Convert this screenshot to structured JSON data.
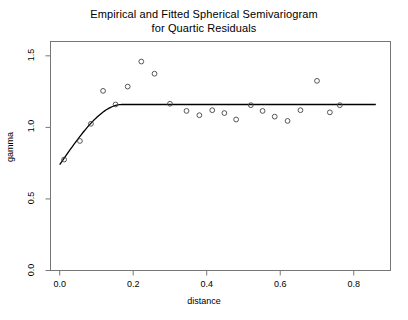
{
  "chart_data": {
    "type": "scatter",
    "title": "Empirical and Fitted Spherical Semivariogram for Quartic Residuals",
    "title_line1": "Empirical and Fitted Spherical Semivariogram",
    "title_line2": "for Quartic Residuals",
    "xlabel": "distance",
    "ylabel": "gamma",
    "xlim": [
      -0.025,
      0.9
    ],
    "ylim": [
      0.0,
      1.6
    ],
    "xticks": [
      0.0,
      0.2,
      0.4,
      0.6,
      0.8
    ],
    "xtick_labels": [
      "0.0",
      "0.2",
      "0.4",
      "0.6",
      "0.8"
    ],
    "yticks": [
      0.0,
      0.5,
      1.0,
      1.5
    ],
    "ytick_labels": [
      "0.0",
      "0.5",
      "1.0",
      "1.5"
    ],
    "grid": false,
    "legend": "none",
    "series": [
      {
        "name": "Empirical semivariogram",
        "marker": "open-circle",
        "color": "#444444",
        "points": [
          {
            "x": 0.012,
            "y": 0.775
          },
          {
            "x": 0.055,
            "y": 0.905
          },
          {
            "x": 0.085,
            "y": 1.025
          },
          {
            "x": 0.118,
            "y": 1.255
          },
          {
            "x": 0.152,
            "y": 1.16
          },
          {
            "x": 0.185,
            "y": 1.285
          },
          {
            "x": 0.222,
            "y": 1.46
          },
          {
            "x": 0.258,
            "y": 1.375
          },
          {
            "x": 0.3,
            "y": 1.165
          },
          {
            "x": 0.345,
            "y": 1.115
          },
          {
            "x": 0.38,
            "y": 1.085
          },
          {
            "x": 0.415,
            "y": 1.12
          },
          {
            "x": 0.448,
            "y": 1.1
          },
          {
            "x": 0.48,
            "y": 1.055
          },
          {
            "x": 0.52,
            "y": 1.155
          },
          {
            "x": 0.552,
            "y": 1.115
          },
          {
            "x": 0.585,
            "y": 1.075
          },
          {
            "x": 0.62,
            "y": 1.045
          },
          {
            "x": 0.655,
            "y": 1.12
          },
          {
            "x": 0.7,
            "y": 1.325
          },
          {
            "x": 0.735,
            "y": 1.105
          },
          {
            "x": 0.762,
            "y": 1.155
          }
        ]
      },
      {
        "name": "Fitted spherical model",
        "marker": "line",
        "color": "#000000",
        "nugget": 0.74,
        "sill": 1.16,
        "range": 0.17,
        "curve_start_x": 0.0,
        "curve_end_x": 0.86
      }
    ]
  }
}
